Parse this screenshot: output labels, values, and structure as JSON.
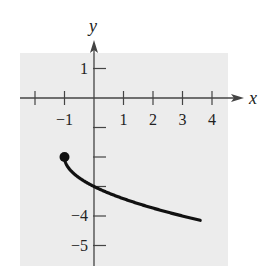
{
  "chart_data": {
    "type": "line",
    "title": "",
    "xlabel": "x",
    "ylabel": "y",
    "xlim": [
      -2.5,
      4.5
    ],
    "ylim": [
      -5.6,
      1.5
    ],
    "grid": false,
    "background_color": "#ececec",
    "x_ticks": [
      -2,
      -1,
      1,
      2,
      3,
      4
    ],
    "x_tick_labels": [
      "",
      "−1",
      "1",
      "2",
      "3",
      "4"
    ],
    "y_ticks": [
      1,
      -1,
      -2,
      -3,
      -4,
      -5
    ],
    "y_tick_labels": [
      "1",
      "",
      "",
      "",
      "−4",
      "−5"
    ],
    "series": [
      {
        "name": "y = -sqrt(x+1) - 2",
        "color": "#111111",
        "x": [
          -1,
          -0.9,
          -0.75,
          -0.5,
          0,
          0.5,
          1,
          1.5,
          2,
          2.5,
          3,
          3.5,
          4,
          4.5
        ],
        "y": [
          -2,
          -2.32,
          -2.5,
          -2.71,
          -3,
          -3.22,
          -3.41,
          -3.58,
          -3.73,
          -3.87,
          -4,
          -4.12,
          -4.24,
          -4.35
        ]
      }
    ],
    "annotations": [
      {
        "type": "closed-point",
        "x": -1,
        "y": -2
      }
    ]
  }
}
